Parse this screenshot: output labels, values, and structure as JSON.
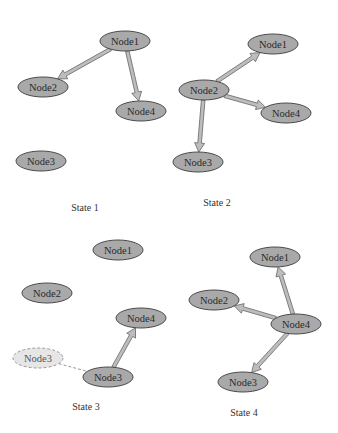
{
  "diagram": {
    "type": "state-transition-graph",
    "panels": [
      {
        "label": "State 1",
        "label_pos": [
          85,
          211
        ],
        "nodes": [
          {
            "id": "Node1",
            "label": "Node1",
            "cx": 125,
            "cy": 41
          },
          {
            "id": "Node2",
            "label": "Node2",
            "cx": 43,
            "cy": 87
          },
          {
            "id": "Node4",
            "label": "Node4",
            "cx": 141,
            "cy": 111
          },
          {
            "id": "Node3",
            "label": "Node3",
            "cx": 41,
            "cy": 161
          }
        ],
        "edges": [
          {
            "from": "Node1",
            "to": "Node2"
          },
          {
            "from": "Node1",
            "to": "Node4"
          }
        ]
      },
      {
        "label": "State 2",
        "label_pos": [
          217,
          206
        ],
        "nodes": [
          {
            "id": "Node1",
            "label": "Node1",
            "cx": 273,
            "cy": 44
          },
          {
            "id": "Node2",
            "label": "Node2",
            "cx": 204,
            "cy": 90
          },
          {
            "id": "Node4",
            "label": "Node4",
            "cx": 286,
            "cy": 113
          },
          {
            "id": "Node3",
            "label": "Node3",
            "cx": 198,
            "cy": 162
          }
        ],
        "edges": [
          {
            "from": "Node2",
            "to": "Node1"
          },
          {
            "from": "Node2",
            "to": "Node4"
          },
          {
            "from": "Node2",
            "to": "Node3"
          }
        ]
      },
      {
        "label": "State 3",
        "label_pos": [
          86,
          410
        ],
        "nodes": [
          {
            "id": "Node1",
            "label": "Node1",
            "cx": 118,
            "cy": 250
          },
          {
            "id": "Node2",
            "label": "Node2",
            "cx": 47,
            "cy": 293
          },
          {
            "id": "Node4",
            "label": "Node4",
            "cx": 141,
            "cy": 318
          },
          {
            "id": "Node3-ghost",
            "label": "Node3",
            "cx": 38,
            "cy": 358,
            "ghost": true
          },
          {
            "id": "Node3",
            "label": "Node3",
            "cx": 108,
            "cy": 377
          }
        ],
        "edges": [
          {
            "from": "Node3",
            "to": "Node4"
          }
        ],
        "dashed_links": [
          {
            "from": "Node3-ghost",
            "to": "Node3"
          }
        ]
      },
      {
        "label": "State 4",
        "label_pos": [
          244,
          416
        ],
        "nodes": [
          {
            "id": "Node1",
            "label": "Node1",
            "cx": 275,
            "cy": 257
          },
          {
            "id": "Node2",
            "label": "Node2",
            "cx": 214,
            "cy": 300
          },
          {
            "id": "Node4",
            "label": "Node4",
            "cx": 296,
            "cy": 324
          },
          {
            "id": "Node3",
            "label": "Node3",
            "cx": 243,
            "cy": 382
          }
        ],
        "edges": [
          {
            "from": "Node4",
            "to": "Node1"
          },
          {
            "from": "Node4",
            "to": "Node2"
          },
          {
            "from": "Node4",
            "to": "Node3"
          }
        ]
      }
    ],
    "colors": {
      "node_fill": "#a9a9a9",
      "node_stroke": "#4a4a4a",
      "ghost_fill": "#e6e6e6",
      "ghost_stroke": "#9a9a9a",
      "edge_fill": "#bdbdbd",
      "edge_stroke": "#666666",
      "background": "#ffffff"
    },
    "node_rx": 25,
    "node_ry": 10
  }
}
